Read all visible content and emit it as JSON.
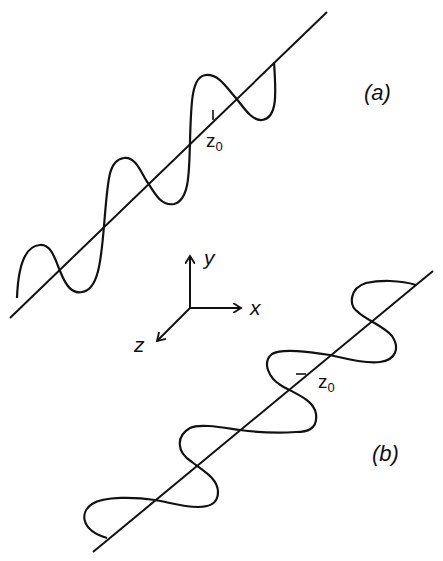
{
  "header": {
    "clipped_text": "Chapter header (clipped)"
  },
  "panel_a": {
    "label": "(a)",
    "z0_label": "z",
    "z0_sub": "0",
    "description": "Linearly polarized wave along diagonal axis"
  },
  "panel_b": {
    "label": "(b)",
    "z0_label": "z",
    "z0_sub": "0",
    "description": "Circularly/helically polarized wave along diagonal axis"
  },
  "axes": {
    "x_label": "x",
    "y_label": "y",
    "z_label": "z"
  },
  "colors": {
    "stroke": "#111111",
    "background": "#ffffff"
  }
}
